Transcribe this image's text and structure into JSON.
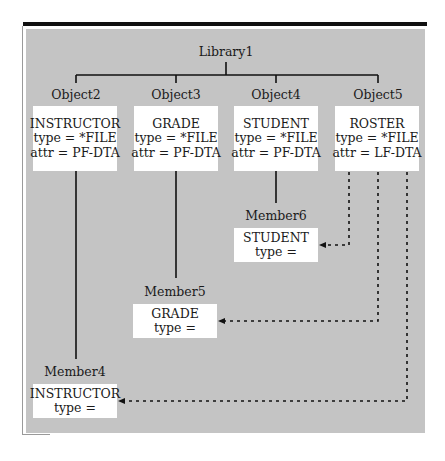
{
  "diagram": {
    "root": {
      "label": "Library1"
    },
    "objects": [
      {
        "label": "Object2",
        "name": "INSTRUCTOR",
        "type": "type = *FILE",
        "attr": "attr = PF-DTA"
      },
      {
        "label": "Object3",
        "name": "GRADE",
        "type": "type = *FILE",
        "attr": "attr = PF-DTA"
      },
      {
        "label": "Object4",
        "name": "STUDENT",
        "type": "type = *FILE",
        "attr": "attr = PF-DTA"
      },
      {
        "label": "Object5",
        "name": "ROSTER",
        "type": "type = *FILE",
        "attr": "attr = LF-DTA"
      }
    ],
    "members": [
      {
        "label": "Member6",
        "name": "STUDENT",
        "type": "type =",
        "parent": "Object4"
      },
      {
        "label": "Member5",
        "name": "GRADE",
        "type": "type =",
        "parent": "Object3"
      },
      {
        "label": "Member4",
        "name": "INSTRUCTOR",
        "type": "type =",
        "parent": "Object2"
      }
    ],
    "dotted_links": [
      {
        "from": "Object5",
        "to": "Member6"
      },
      {
        "from": "Object5",
        "to": "Member5"
      },
      {
        "from": "Object5",
        "to": "Member4"
      }
    ],
    "colors": {
      "panel": "#c4c4c4",
      "box": "#ffffff",
      "line": "#111111"
    }
  }
}
